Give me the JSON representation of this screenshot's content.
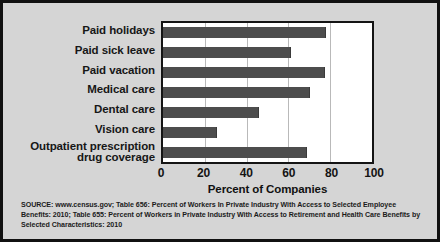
{
  "chart_data": {
    "type": "bar",
    "orientation": "horizontal",
    "title": "",
    "xlabel": "Percent of Companies",
    "ylabel": "",
    "xlim": [
      0,
      100
    ],
    "xticks": [
      0,
      20,
      40,
      60,
      80,
      100
    ],
    "xtick_labels": [
      "0",
      "20",
      "40",
      "60",
      "80",
      "100"
    ],
    "grid": "vertical gridlines at 20, 40, 60, 80",
    "legend": "none",
    "categories": [
      "Paid holidays",
      "Paid sick leave",
      "Paid vacation",
      "Medical care",
      "Dental care",
      "Vision care",
      "Outpatient prescription\ndrug coverage"
    ],
    "values": [
      77.5,
      61,
      77,
      70,
      45.5,
      25.5,
      68.5
    ],
    "bar_color": "#4d4d4d",
    "plot_background": "#ffffff",
    "panel_background": "#d5d5d5"
  },
  "source_note": "SOURCE: www.census.gov; Table 656: Percent of Workers In Private Industry With Access to Selected Employee Benefits: 2010; Table 655: Percent of Workers in Private Industry With Access to Retirement and Health Care Benefits by Selected Characteristics: 2010"
}
